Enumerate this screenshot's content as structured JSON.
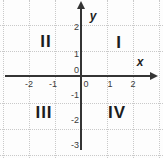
{
  "figure": {
    "type": "coordinate-plane",
    "axis_labels": {
      "x": "x",
      "y": "y"
    },
    "quadrant_labels": {
      "q1": "I",
      "q2": "II",
      "q3": "III",
      "q4": "IV"
    },
    "x_tick_labels": [
      "-2",
      "-1",
      "0",
      "1",
      "2"
    ],
    "y_tick_labels": [
      "2",
      "1",
      "0",
      "-1",
      "-2",
      "-3"
    ],
    "axis_ranges": {
      "x": [
        -3,
        3
      ],
      "y": [
        -3,
        3
      ]
    },
    "grid": "on",
    "colors": {
      "background": "#fdfdfd",
      "axis": "#343434",
      "grid": "#c9c9c9",
      "tick_text": "#3a3a3a",
      "label_text": "#1c1c1c"
    }
  }
}
